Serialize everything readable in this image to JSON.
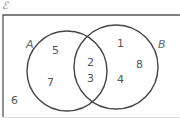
{
  "universal_set_symbol": "ℰ",
  "sets": [
    {
      "label": "A",
      "cx": 66,
      "cy": 70,
      "r": 40
    },
    {
      "label": "B",
      "cx": 115,
      "cy": 66,
      "r": 42
    }
  ],
  "regions": {
    "A_only": [
      "5",
      "7"
    ],
    "A_and_B": [
      "2",
      "3"
    ],
    "B_only": [
      "1",
      "8",
      "4"
    ],
    "neither": [
      "6"
    ]
  },
  "colors": {
    "line": "#444444",
    "frame": "#555555",
    "text": "#555555"
  }
}
